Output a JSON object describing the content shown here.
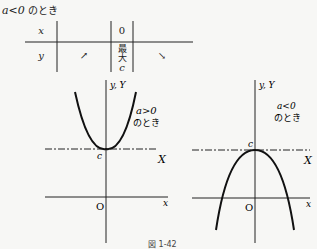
{
  "title": {
    "condition": "a<0",
    "suffix": "のとき"
  },
  "variation_table": {
    "row_x": {
      "label": "x",
      "cells": [
        "",
        "0",
        ""
      ]
    },
    "row_y": {
      "label": "y",
      "cells": [
        "↗",
        "最大 c",
        "↘"
      ],
      "max_label": "最大",
      "max_value": "c"
    }
  },
  "left_graph": {
    "axis_y_label": "y, Y",
    "axis_x_label": "x",
    "axis_X_label": "X",
    "origin_label": "O",
    "vertex_label": "c",
    "note_condition": "a>0",
    "note_suffix": "のとき"
  },
  "right_graph": {
    "axis_y_label": "y, Y",
    "axis_x_label": "x",
    "axis_X_label": "X",
    "origin_label": "O",
    "vertex_label": "c",
    "note_condition": "a<0",
    "note_suffix": "のとき"
  },
  "caption": "図 1-42"
}
